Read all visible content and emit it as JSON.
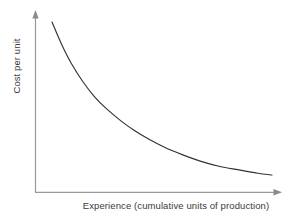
{
  "chart_data": {
    "type": "line",
    "title": "",
    "subtitle": "",
    "xlabel": "Experience (cumulative units of production)",
    "ylabel": "Cost per unit",
    "grid": false,
    "legend": false,
    "legend_position": "none",
    "xticks": [],
    "yticks": [],
    "xtick_labels": [],
    "ytick_labels": [],
    "xlim": [
      0,
      100
    ],
    "ylim": [
      0,
      100
    ],
    "annotations": [],
    "series": [
      {
        "name": "Cost per unit",
        "color": "#333333",
        "x": [
          7,
          11,
          15,
          20,
          25,
          30,
          36,
          42,
          48,
          55,
          62,
          70,
          78,
          86,
          94,
          100
        ],
        "y": [
          96,
          83,
          72,
          61,
          52,
          45,
          38,
          32,
          27,
          22,
          18,
          14,
          11,
          9,
          7,
          6
        ]
      }
    ]
  },
  "axes": {
    "x_axis_name": "x-axis",
    "y_axis_name": "y-axis",
    "axis_color": "#999999",
    "arrow_color": "#808080",
    "curve_color": "#333333",
    "label_color": "#3a3a3a",
    "background": "#ffffff"
  },
  "labels": {
    "x": "Experience (cumulative units of production)",
    "y": "Cost per unit"
  }
}
